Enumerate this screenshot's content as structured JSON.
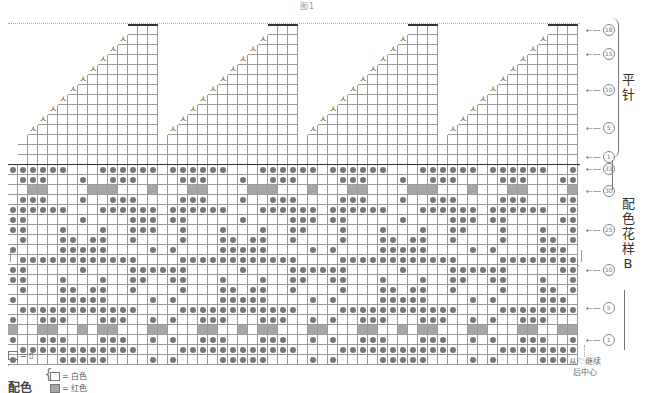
{
  "title": "图1",
  "chart": {
    "cols": 57,
    "cell_px": 10,
    "origin_x": 8,
    "colors": {
      "grid": "#999999",
      "dot": "#777777",
      "gray_cell": "#a6a6a6",
      "thick": "#333333"
    },
    "triangles": {
      "count": 4,
      "right_cols": [
        14,
        28,
        42,
        56
      ],
      "rows_total": 18,
      "top_row_y": 23,
      "base_y": 153,
      "decrease_symbol": "ㅅ"
    },
    "band_upper": {
      "top_y": 165,
      "rows": [
        "oooooo...oooooo.oooooo...oooooo.oooooo...oooooo.oooooo..o",
        ".ooo...o..ooo....ooo...o..ooo....ooo...o..ooo....ooo...oo",
        "..gg....ggg...g...gg....ggg...g...gg....ggg...g...gg....g",
        ".ooo...o..ooo....ooo...o..ooo....ooo...o..ooo....ooo...oo",
        "oooooo...oooooo.oooooo...oooooo.oooooo...oooooo.oooooo..o",
        "oo.....o....ooo.oo.....o....ooo.oo.....o....ooo.oo.....oo",
        "oo...o...o..ooo..o...o...o..oo...o...o...o..oo...o...o..o",
        ".o...oo.oo..o....o...oo.oo..o....o...oo.oo..o....o...oo.o",
        "o....ooooo....o.o....ooooo....o.o....ooooo....o.o....ooo.",
        ".oooooooooooo....oooooooooooo....oooooooooooo....oooooooo."
      ]
    },
    "band_lower": {
      "top_y": 265,
      "rows": [
        "oo.....o....oooooo.....o....oooooo.....o....oooooo.....oooo",
        "oo...o...o..oo..oo...o...o..oo..oo...o...o..oo..oo...o..o",
        ".o...oo.oo..o....o...oo.oo..o....o...oo.oo..o....o...oo.o",
        "o....ooooo....o.o....ooooo....o.o....ooooo....o.o....ooo.",
        ".oooooooooooo....oooooooooooo....oooooooooooo....oooooooo.",
        "o..ooo...ooo..o.o..ooo...ooo..o.o..ooo...ooo..o.o..ooo...",
        "g..gg..g.gg...gg...gg..g.gg...gg...gg..g.gg...gg...gg..gg",
        "o..ooo...ooo..o.o..ooo...ooo..o.o..ooo...ooo..o.o..ooo..o",
        ".oooooooooooo....oooooooooooo....oooooooooooo....oooooooo.",
        "o....ooooo....o.o....ooooo....o.o....ooooo....o.o....ooo."
      ]
    }
  },
  "row_labels": [
    {
      "num": "18",
      "y": 30
    },
    {
      "num": "15",
      "y": 54
    },
    {
      "num": "10",
      "y": 90
    },
    {
      "num": "5",
      "y": 128
    },
    {
      "num": "1",
      "y": 157
    },
    {
      "num": "33",
      "y": 169
    },
    {
      "num": "30",
      "y": 191
    },
    {
      "num": "25",
      "y": 230
    },
    {
      "num": "10",
      "y": 270
    },
    {
      "num": "5",
      "y": 308
    },
    {
      "num": "1",
      "y": 340
    }
  ],
  "side_labels": {
    "plain_knit": "平针",
    "color_pattern": "配色花样B"
  },
  "legend": {
    "symbol_equals": "= ▯",
    "color_title": "配色",
    "white": "= 白色",
    "red": "= 红色"
  },
  "note": {
    "line1": "从♡继续",
    "line2": "后中心"
  }
}
